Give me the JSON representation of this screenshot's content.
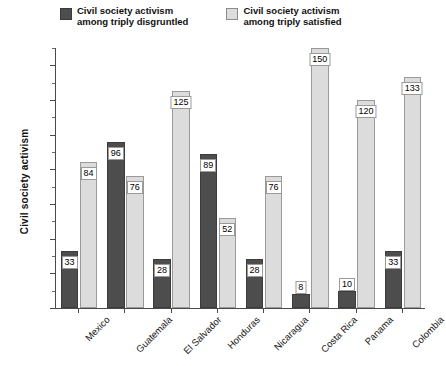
{
  "chart_data": {
    "type": "bar",
    "title": "",
    "xlabel": "",
    "ylabel": "Civil society activism",
    "ylim": [
      0,
      150
    ],
    "yticks": [
      0,
      20,
      40,
      60,
      80,
      100,
      120,
      140
    ],
    "ytick_labels": [
      "0",
      "20",
      "40",
      "60",
      "80",
      "100",
      "120",
      "140"
    ],
    "minor_tick_step": 10,
    "grid": false,
    "legend_position": "top",
    "categories": [
      "Mexico",
      "Guatemala",
      "El Salvador",
      "Honduras",
      "Nicaragua",
      "Costa Rica",
      "Panama",
      "Colombia"
    ],
    "series": [
      {
        "name": "Civil society activism among triply disgruntled",
        "color": "#4d4d4d",
        "values": [
          33,
          96,
          28,
          89,
          28,
          8,
          10,
          33
        ]
      },
      {
        "name": "Civil society activism among triply satisfied",
        "color": "#dcdcdc",
        "values": [
          84,
          76,
          125,
          52,
          76,
          150,
          120,
          133
        ]
      }
    ]
  },
  "legend": {
    "entries": [
      {
        "swatch": "dark-swatch",
        "line1": "Civil society activism",
        "line2": "among triply disgruntled"
      },
      {
        "swatch": "light-swatch",
        "line1": "Civil society activism",
        "line2": "among triply satisfied"
      }
    ]
  },
  "axes": {
    "y_title": "Civil society activism"
  }
}
